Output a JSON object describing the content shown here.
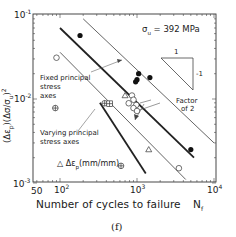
{
  "chart_data": {
    "type": "scatter",
    "title": "",
    "caption": "(f)",
    "annotation_material": "σu = 392 MPa",
    "xlabel": "Number of cycles to failure",
    "xlabel_symbol": "Nf",
    "ylabel": "(Δεp)(Δσ/σu)^2",
    "xscale": "log",
    "yscale": "log",
    "xlim": [
      50,
      10000
    ],
    "ylim": [
      0.001,
      0.1
    ],
    "xticks": [
      "50",
      "10^2",
      "10^3",
      "10^4"
    ],
    "yticks": [
      "10^-3",
      "10^-2",
      "10^-1"
    ],
    "grid": false,
    "slope_indicator": {
      "run": "1",
      "rise": "-1"
    },
    "annotations": [
      "Fixed principal stress axes",
      "Varying principal stress axes",
      "Factor of 2",
      "Δεp(mm/mm)"
    ],
    "series": [
      {
        "name": "Fixed principal stress axes (filled)",
        "marker": "filled-circle",
        "points": [
          [
            182,
            0.057
          ],
          [
            1050,
            0.02
          ],
          [
            1000,
            0.017
          ],
          [
            960,
            0.016
          ],
          [
            1470,
            0.018
          ],
          [
            5000,
            0.0025
          ]
        ]
      },
      {
        "name": "Open circles",
        "marker": "open-circle",
        "points": [
          [
            90,
            0.031
          ],
          [
            860,
            0.011
          ],
          [
            900,
            0.0098
          ],
          [
            780,
            0.0089
          ],
          [
            980,
            0.0085
          ],
          [
            900,
            0.0078
          ],
          [
            1000,
            0.0072
          ],
          [
            3500,
            0.0015
          ]
        ]
      },
      {
        "name": "Varying principal stress axes (crossed)",
        "marker": "crossed-circle",
        "points": [
          [
            87,
            0.0078
          ],
          [
            380,
            0.0089
          ],
          [
            620,
            0.0016
          ]
        ]
      },
      {
        "name": "Crossed square",
        "marker": "crossed-square",
        "points": [
          [
            440,
            0.0088
          ]
        ]
      },
      {
        "name": "Open triangles",
        "marker": "open-triangle",
        "points": [
          [
            700,
            0.011
          ],
          [
            1420,
            0.0025
          ]
        ]
      }
    ],
    "lines": [
      {
        "name": "Fixed mean (bold)",
        "style": "solid-bold",
        "from": [
          100,
          0.07
        ],
        "to": [
          5500,
          0.002
        ]
      },
      {
        "name": "Fixed upper bound",
        "style": "solid-thin",
        "from": [
          200,
          0.09
        ],
        "to": [
          10000,
          0.003
        ]
      },
      {
        "name": "Fixed lower bound",
        "style": "solid-thin",
        "from": [
          100,
          0.036
        ],
        "to": [
          4300,
          0.0011
        ]
      },
      {
        "name": "Varying mean (bold)",
        "style": "solid-bold",
        "from": [
          330,
          0.009
        ],
        "to": [
          1300,
          0.0013
        ]
      }
    ]
  },
  "labels": {
    "sigma_u": "σ",
    "sigma_u_sub": "u",
    "sigma_u_value": " = 392 MPa",
    "slope_run": "1",
    "slope_rise": "-1",
    "fixed_line1": "Fixed principal",
    "fixed_line2": "stress",
    "fixed_line3": "axes",
    "varying_line1": "Varying principal",
    "varying_line2": "stress axes",
    "factor_line1": "Factor",
    "factor_line2": "of 2",
    "delta_ep": "Δε",
    "delta_ep_sub": "p",
    "delta_ep_unit": "(mm/mm)",
    "ylabel": "(Δε",
    "ylabel_sub": "p",
    "ylabel_rest": ")(Δσ/σ",
    "ylabel_sub2": "u",
    "ylabel_end": ")",
    "ylabel_sup": "2",
    "xtick_50": "50",
    "xtick_100": "10",
    "xtick_100_sup": "2",
    "xtick_1000": "10",
    "xtick_1000_sup": "3",
    "xtick_10000": "10",
    "xtick_10000_sup": "4",
    "ytick_m1": "10",
    "ytick_m1_sup": "-1",
    "ytick_m2": "10",
    "ytick_m2_sup": "-2",
    "ytick_m3": "10",
    "ytick_m3_sup": "-3",
    "xlabel": "Number of cycles to failure",
    "xlabel_sym": "N",
    "xlabel_sym_sub": "f",
    "caption": "(f)"
  }
}
